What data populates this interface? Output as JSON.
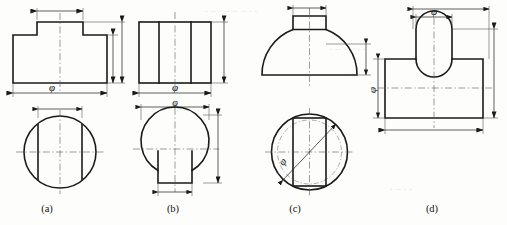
{
  "figure": {
    "background_color": "#fdfdfc",
    "line_color": "#1a1a1a",
    "center_line_color": "#5a5a5a"
  },
  "captions": {
    "a": "(a)",
    "b": "(b)",
    "c": "(c)",
    "d": "(d)"
  },
  "symbols": {
    "diameter": "φ"
  },
  "views": {
    "a": {
      "name": "view-a",
      "front_view": "stepped T-block front view",
      "top_view": "circle with two vertical chord lines",
      "dimension_top": "φ",
      "dimension_bottom": "φ"
    },
    "b": {
      "name": "view-b",
      "front_view": "rectangle with two internal vertical lines",
      "top_view": "circle with rectangular notch at bottom",
      "dimension_front": "φ",
      "dimension_top": "φ"
    },
    "c": {
      "name": "view-c",
      "front_view": "semicircular dome with rectangular slot cut in top",
      "top_view": "circle with inner dashed circle, vertical rectangle and diagonal diameter",
      "dimension_diagonal": "φ"
    },
    "d": {
      "name": "view-d",
      "front_view": "T-shape with concave fillet arc at stem junction",
      "dimension_top": "φ",
      "dimension_left": "φ"
    }
  }
}
